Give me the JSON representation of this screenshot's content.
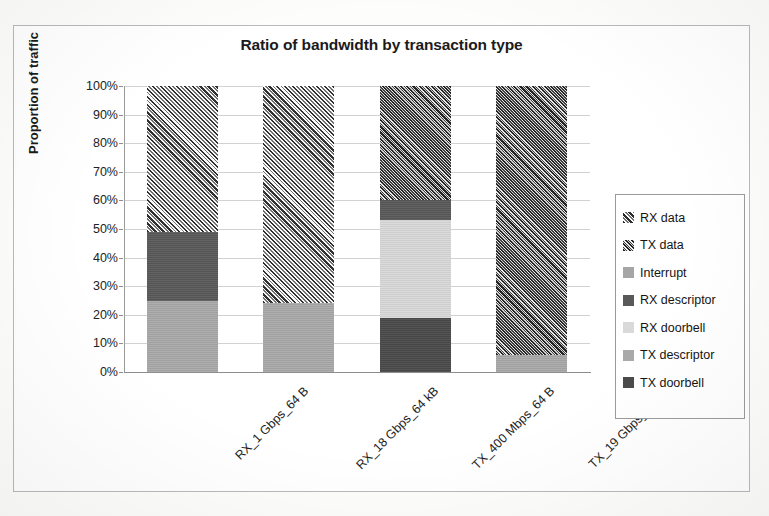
{
  "chart_data": {
    "type": "bar",
    "subtype": "stacked-100-percent",
    "title": "Ratio of bandwidth by transaction type",
    "xlabel": "",
    "ylabel": "Proportion of traffic",
    "ylim": [
      0,
      100
    ],
    "ytick_labels": [
      "100%",
      "90%",
      "80%",
      "70%",
      "60%",
      "50%",
      "40%",
      "30%",
      "20%",
      "10%",
      "0%"
    ],
    "ytick_values": [
      100,
      90,
      80,
      70,
      60,
      50,
      40,
      30,
      20,
      10,
      0
    ],
    "grid": true,
    "legend_position": "right",
    "categories": [
      "RX_1 Gbps_64 B",
      "RX_18 Gbps_64 kB",
      "TX_400 Mbps_64 B",
      "TX_19 Gbps_64 kB"
    ],
    "series": [
      {
        "name": "RX data",
        "pattern": "diagonal-hatch-up",
        "color": "#9a9a9a",
        "values": [
          51,
          76,
          0,
          0
        ]
      },
      {
        "name": "TX data",
        "pattern": "diagonal-hatch-dense",
        "color": "#8e8e8e",
        "values": [
          0,
          0,
          40,
          94
        ]
      },
      {
        "name": "Interrupt",
        "pattern": "solid",
        "color": "#a6a6a6",
        "values": [
          0,
          0,
          0,
          0
        ]
      },
      {
        "name": "RX descriptor",
        "pattern": "solid",
        "color": "#595959",
        "values": [
          24,
          0,
          7,
          0
        ]
      },
      {
        "name": "RX doorbell",
        "pattern": "solid",
        "color": "#d9d9d9",
        "values": [
          0,
          0,
          34,
          0
        ]
      },
      {
        "name": "TX descriptor",
        "pattern": "solid",
        "color": "#a9a9a9",
        "values": [
          25,
          24,
          0,
          6
        ]
      },
      {
        "name": "TX doorbell",
        "pattern": "solid",
        "color": "#4a4a4a",
        "values": [
          0,
          0,
          19,
          0
        ]
      }
    ]
  },
  "legend": {
    "items": [
      {
        "label": "RX data",
        "swatch": "rx-data-swatch"
      },
      {
        "label": "TX data",
        "swatch": "tx-data-swatch"
      },
      {
        "label": "Interrupt",
        "swatch": "interrupt-swatch"
      },
      {
        "label": "RX descriptor",
        "swatch": "rx-descriptor-swatch"
      },
      {
        "label": "RX doorbell",
        "swatch": "rx-doorbell-swatch"
      },
      {
        "label": "TX descriptor",
        "swatch": "tx-descriptor-swatch"
      },
      {
        "label": "TX doorbell",
        "swatch": "tx-doorbell-swatch"
      }
    ]
  }
}
